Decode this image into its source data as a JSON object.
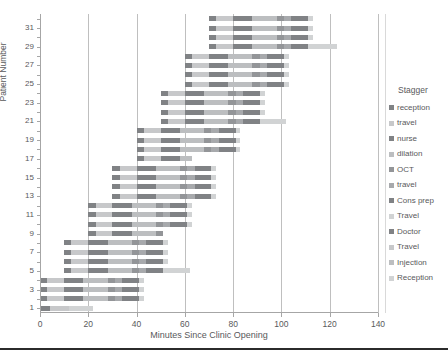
{
  "chart_data": {
    "type": "bar",
    "subtype": "stacked-horizontal-gantt",
    "title": "",
    "xlabel": "Minutes Since Clinic Opening",
    "ylabel": "Patient Number",
    "xlim": [
      0,
      140
    ],
    "xticks": [
      0,
      20,
      40,
      60,
      80,
      100,
      120,
      140
    ],
    "yticks": [
      1,
      3,
      5,
      7,
      9,
      11,
      13,
      15,
      17,
      19,
      21,
      23,
      25,
      27,
      29,
      31
    ],
    "ylim": [
      0.5,
      32.5
    ],
    "grid": "vertical",
    "legend_position": "right",
    "legend_title": "Stagger",
    "series": [
      {
        "name": "reception",
        "color": "#808285"
      },
      {
        "name": "travel",
        "color": "#c7c8ca"
      },
      {
        "name": "nurse",
        "color": "#808285"
      },
      {
        "name": "dilation",
        "color": "#bcbec0"
      },
      {
        "name": "OCT",
        "color": "#939598"
      },
      {
        "name": "travel",
        "color": "#a7a9ac"
      },
      {
        "name": "Cons prep",
        "color": "#808285"
      },
      {
        "name": "Travel",
        "color": "#d1d3d4"
      },
      {
        "name": "Doctor",
        "color": "#808285"
      },
      {
        "name": "Travel",
        "color": "#c7c8ca"
      },
      {
        "name": "Injection",
        "color": "#bcbec0"
      },
      {
        "name": "Reception",
        "color": "#d1d3d4"
      }
    ],
    "categories": [
      1,
      2,
      3,
      4,
      5,
      6,
      7,
      8,
      9,
      10,
      11,
      12,
      13,
      14,
      15,
      16,
      17,
      18,
      19,
      20,
      21,
      22,
      23,
      24,
      25,
      26,
      27,
      28,
      29,
      30,
      31,
      32
    ],
    "bars": [
      {
        "patient": 1,
        "start": 0,
        "segments": [
          4,
          8,
          0,
          0,
          0,
          0,
          0,
          0,
          0,
          0,
          0,
          10
        ]
      },
      {
        "patient": 2,
        "start": 0,
        "segments": [
          3,
          7,
          8,
          10,
          3,
          3,
          7,
          2,
          0,
          0,
          0,
          0
        ]
      },
      {
        "patient": 3,
        "start": 0,
        "segments": [
          3,
          7,
          8,
          10,
          3,
          3,
          7,
          2,
          0,
          0,
          0,
          0
        ]
      },
      {
        "patient": 4,
        "start": 0,
        "segments": [
          3,
          7,
          8,
          10,
          3,
          3,
          7,
          2,
          0,
          0,
          0,
          0
        ]
      },
      {
        "patient": 5,
        "start": 10,
        "segments": [
          3,
          7,
          8,
          10,
          3,
          3,
          7,
          2,
          0,
          0,
          0,
          9
        ]
      },
      {
        "patient": 6,
        "start": 10,
        "segments": [
          3,
          7,
          8,
          10,
          3,
          3,
          7,
          2,
          0,
          0,
          0,
          0
        ]
      },
      {
        "patient": 7,
        "start": 10,
        "segments": [
          3,
          7,
          8,
          10,
          3,
          3,
          7,
          2,
          0,
          0,
          0,
          0
        ]
      },
      {
        "patient": 8,
        "start": 10,
        "segments": [
          3,
          7,
          8,
          10,
          3,
          3,
          7,
          2,
          0,
          0,
          0,
          0
        ]
      },
      {
        "patient": 9,
        "start": 20,
        "segments": [
          3,
          7,
          8,
          10,
          3,
          0,
          0,
          0,
          0,
          0,
          0,
          0
        ]
      },
      {
        "patient": 10,
        "start": 20,
        "segments": [
          3,
          7,
          8,
          10,
          3,
          3,
          7,
          2,
          0,
          0,
          0,
          0
        ]
      },
      {
        "patient": 11,
        "start": 20,
        "segments": [
          3,
          7,
          8,
          10,
          3,
          3,
          7,
          2,
          0,
          0,
          0,
          0
        ]
      },
      {
        "patient": 12,
        "start": 20,
        "segments": [
          3,
          7,
          8,
          10,
          3,
          3,
          7,
          2,
          0,
          0,
          0,
          0
        ]
      },
      {
        "patient": 13,
        "start": 30,
        "segments": [
          3,
          7,
          8,
          10,
          3,
          3,
          7,
          2,
          0,
          0,
          0,
          0
        ]
      },
      {
        "patient": 14,
        "start": 30,
        "segments": [
          3,
          7,
          8,
          10,
          3,
          3,
          7,
          2,
          0,
          0,
          0,
          0
        ]
      },
      {
        "patient": 15,
        "start": 30,
        "segments": [
          3,
          7,
          8,
          10,
          3,
          3,
          7,
          2,
          0,
          0,
          0,
          0
        ]
      },
      {
        "patient": 16,
        "start": 30,
        "segments": [
          3,
          7,
          8,
          10,
          3,
          3,
          7,
          2,
          0,
          0,
          0,
          0
        ]
      },
      {
        "patient": 17,
        "start": 40,
        "segments": [
          3,
          7,
          8,
          5,
          0,
          0,
          0,
          0,
          0,
          0,
          0,
          0
        ]
      },
      {
        "patient": 18,
        "start": 40,
        "segments": [
          3,
          7,
          8,
          10,
          3,
          3,
          7,
          2,
          0,
          0,
          0,
          0
        ]
      },
      {
        "patient": 19,
        "start": 40,
        "segments": [
          3,
          7,
          8,
          10,
          3,
          3,
          7,
          2,
          0,
          0,
          0,
          0
        ]
      },
      {
        "patient": 20,
        "start": 40,
        "segments": [
          3,
          7,
          8,
          10,
          3,
          3,
          7,
          2,
          0,
          0,
          0,
          0
        ]
      },
      {
        "patient": 21,
        "start": 50,
        "segments": [
          3,
          7,
          8,
          10,
          3,
          3,
          7,
          2,
          0,
          0,
          0,
          9
        ]
      },
      {
        "patient": 22,
        "start": 50,
        "segments": [
          3,
          7,
          8,
          10,
          3,
          3,
          7,
          2,
          0,
          0,
          0,
          0
        ]
      },
      {
        "patient": 23,
        "start": 50,
        "segments": [
          3,
          7,
          8,
          10,
          3,
          3,
          7,
          2,
          0,
          0,
          0,
          0
        ]
      },
      {
        "patient": 24,
        "start": 50,
        "segments": [
          3,
          7,
          8,
          10,
          3,
          3,
          7,
          2,
          0,
          0,
          0,
          0
        ]
      },
      {
        "patient": 25,
        "start": 60,
        "segments": [
          3,
          7,
          8,
          10,
          3,
          3,
          7,
          2,
          0,
          0,
          0,
          0
        ]
      },
      {
        "patient": 26,
        "start": 60,
        "segments": [
          3,
          7,
          8,
          10,
          3,
          3,
          7,
          2,
          0,
          0,
          0,
          0
        ]
      },
      {
        "patient": 27,
        "start": 60,
        "segments": [
          3,
          7,
          8,
          10,
          3,
          3,
          7,
          2,
          0,
          0,
          0,
          0
        ]
      },
      {
        "patient": 28,
        "start": 60,
        "segments": [
          3,
          7,
          8,
          10,
          3,
          3,
          7,
          2,
          0,
          0,
          0,
          0
        ]
      },
      {
        "patient": 29,
        "start": 70,
        "segments": [
          3,
          7,
          8,
          10,
          3,
          3,
          7,
          2,
          0,
          0,
          0,
          10
        ]
      },
      {
        "patient": 30,
        "start": 70,
        "segments": [
          3,
          7,
          8,
          10,
          3,
          3,
          7,
          2,
          0,
          0,
          0,
          0
        ]
      },
      {
        "patient": 31,
        "start": 70,
        "segments": [
          3,
          7,
          8,
          10,
          3,
          3,
          7,
          2,
          0,
          0,
          0,
          0
        ]
      },
      {
        "patient": 32,
        "start": 70,
        "segments": [
          3,
          7,
          8,
          10,
          3,
          3,
          7,
          2,
          0,
          0,
          0,
          0
        ]
      }
    ]
  },
  "axes": {
    "x_title": "Minutes Since Clinic Opening",
    "y_title": "Patient Number",
    "x_tick_labels": [
      "0",
      "20",
      "40",
      "60",
      "80",
      "100",
      "120",
      "140"
    ],
    "y_tick_labels": [
      "1",
      "3",
      "5",
      "7",
      "9",
      "11",
      "13",
      "15",
      "17",
      "19",
      "21",
      "23",
      "25",
      "27",
      "29",
      "31"
    ]
  },
  "legend": {
    "title": "Stagger",
    "items": [
      {
        "label": "reception",
        "color": "#808285"
      },
      {
        "label": "travel",
        "color": "#c7c8ca"
      },
      {
        "label": "nurse",
        "color": "#808285"
      },
      {
        "label": "dilation",
        "color": "#bcbec0"
      },
      {
        "label": "OCT",
        "color": "#939598"
      },
      {
        "label": "travel",
        "color": "#a7a9ac"
      },
      {
        "label": "Cons prep",
        "color": "#808285"
      },
      {
        "label": "Travel",
        "color": "#d1d3d4"
      },
      {
        "label": "Doctor",
        "color": "#808285"
      },
      {
        "label": "Travel",
        "color": "#c7c8ca"
      },
      {
        "label": "Injection",
        "color": "#bcbec0"
      },
      {
        "label": "Reception",
        "color": "#d1d3d4"
      }
    ]
  },
  "colors": {
    "grid": "#bfbfbf",
    "axis": "#a6a6a6",
    "text": "#59595b",
    "rule": "#2b2b2b",
    "background": "#ffffff"
  }
}
